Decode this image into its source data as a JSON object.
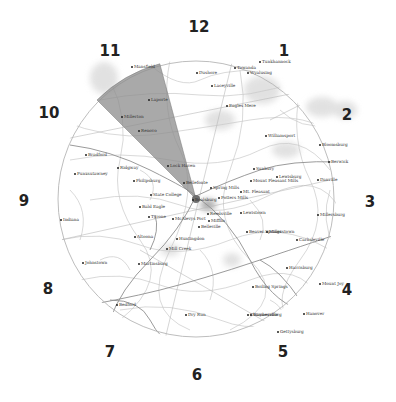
{
  "map": {
    "center": {
      "x": 196,
      "y": 199
    },
    "radius": 138,
    "highlight_sector": {
      "from_hour": 10.5,
      "to_hour": 11.5,
      "color": "#8c8c8c"
    },
    "colors": {
      "ring": "#bdbdbd",
      "roads": "#c8c8c8",
      "major_roads": "#8e8e8e",
      "urban": "#d9d9d9"
    }
  },
  "clock_labels": [
    {
      "id": "12",
      "label": "12",
      "x": 199,
      "y": 27
    },
    {
      "id": "1",
      "label": "1",
      "x": 284,
      "y": 51
    },
    {
      "id": "2",
      "label": "2",
      "x": 347,
      "y": 115
    },
    {
      "id": "3",
      "label": "3",
      "x": 370,
      "y": 202
    },
    {
      "id": "4",
      "label": "4",
      "x": 347,
      "y": 290
    },
    {
      "id": "5",
      "label": "5",
      "x": 283,
      "y": 352
    },
    {
      "id": "6",
      "label": "6",
      "x": 197,
      "y": 375
    },
    {
      "id": "7",
      "label": "7",
      "x": 110,
      "y": 352
    },
    {
      "id": "8",
      "label": "8",
      "x": 48,
      "y": 289
    },
    {
      "id": "9",
      "label": "9",
      "x": 24,
      "y": 201
    },
    {
      "id": "10",
      "label": "10",
      "x": 49,
      "y": 113
    },
    {
      "id": "11",
      "label": "11",
      "x": 110,
      "y": 51
    }
  ],
  "cities": [
    {
      "name": "Mansfield",
      "x": 131,
      "y": 67
    },
    {
      "name": "Laporte",
      "x": 148,
      "y": 100
    },
    {
      "name": "Millerton",
      "x": 121,
      "y": 117
    },
    {
      "name": "Renovo",
      "x": 138,
      "y": 131
    },
    {
      "name": "Lock Haven",
      "x": 167,
      "y": 166
    },
    {
      "name": "Bellefonte",
      "x": 183,
      "y": 183
    },
    {
      "name": "State College",
      "x": 150,
      "y": 195
    },
    {
      "name": "Boalsburg",
      "x": 192,
      "y": 200
    },
    {
      "name": "Spring Mills",
      "x": 210,
      "y": 188
    },
    {
      "name": "Potters Mills",
      "x": 218,
      "y": 198
    },
    {
      "name": "Bald Eagle",
      "x": 139,
      "y": 207
    },
    {
      "name": "Tyrone",
      "x": 148,
      "y": 217
    },
    {
      "name": "McAlevys Fort",
      "x": 172,
      "y": 219
    },
    {
      "name": "Reedsville",
      "x": 207,
      "y": 214
    },
    {
      "name": "Belleville",
      "x": 198,
      "y": 227
    },
    {
      "name": "Mifflin",
      "x": 208,
      "y": 221
    },
    {
      "name": "Huntingdon",
      "x": 176,
      "y": 239
    },
    {
      "name": "Mill Creek",
      "x": 166,
      "y": 249
    },
    {
      "name": "Lewistown",
      "x": 240,
      "y": 213
    },
    {
      "name": "Mount Pleasant Mills",
      "x": 250,
      "y": 181
    },
    {
      "name": "Mt. Pleasant",
      "x": 240,
      "y": 192
    },
    {
      "name": "Beaver Springs",
      "x": 246,
      "y": 232
    },
    {
      "name": "Millerstown",
      "x": 266,
      "y": 232
    },
    {
      "name": "Carlisleville",
      "x": 296,
      "y": 240
    },
    {
      "name": "Sunbury",
      "x": 253,
      "y": 169
    },
    {
      "name": "Lewisburg",
      "x": 276,
      "y": 177
    },
    {
      "name": "Millersburg",
      "x": 317,
      "y": 215
    },
    {
      "name": "Danville",
      "x": 317,
      "y": 180
    },
    {
      "name": "Berwick",
      "x": 328,
      "y": 162
    },
    {
      "name": "Bloomsburg",
      "x": 319,
      "y": 145
    },
    {
      "name": "Williamsport",
      "x": 265,
      "y": 136
    },
    {
      "name": "Eagles Mere",
      "x": 226,
      "y": 106
    },
    {
      "name": "Laceyville",
      "x": 211,
      "y": 86
    },
    {
      "name": "Dushore",
      "x": 196,
      "y": 73
    },
    {
      "name": "Towanda",
      "x": 234,
      "y": 68
    },
    {
      "name": "Tunkhannock",
      "x": 259,
      "y": 62
    },
    {
      "name": "Wyalusing",
      "x": 247,
      "y": 73
    },
    {
      "name": "Bradford",
      "x": 85,
      "y": 155
    },
    {
      "name": "Ridgway",
      "x": 117,
      "y": 168
    },
    {
      "name": "Punxsutawney",
      "x": 74,
      "y": 174
    },
    {
      "name": "Philipsburg",
      "x": 133,
      "y": 181
    },
    {
      "name": "Indiana",
      "x": 60,
      "y": 220
    },
    {
      "name": "Johnstown",
      "x": 82,
      "y": 263
    },
    {
      "name": "Altoona",
      "x": 134,
      "y": 237
    },
    {
      "name": "Martinsburg",
      "x": 138,
      "y": 264
    },
    {
      "name": "Bedford",
      "x": 116,
      "y": 305
    },
    {
      "name": "Dry Run",
      "x": 185,
      "y": 315
    },
    {
      "name": "Chambersburg",
      "x": 247,
      "y": 315
    },
    {
      "name": "Harrisburg",
      "x": 286,
      "y": 268
    },
    {
      "name": "Boiling Springs",
      "x": 252,
      "y": 287
    },
    {
      "name": "Mount Joy",
      "x": 319,
      "y": 284
    },
    {
      "name": "Waynesville",
      "x": 250,
      "y": 315
    },
    {
      "name": "Gettysburg",
      "x": 277,
      "y": 332
    },
    {
      "name": "Hanover",
      "x": 303,
      "y": 314
    }
  ]
}
